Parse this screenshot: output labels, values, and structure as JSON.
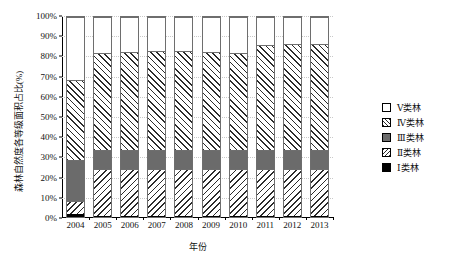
{
  "chart_data": {
    "type": "bar",
    "title": "",
    "subtitle": "",
    "stacked": true,
    "normalized_100": true,
    "xlabel": "年份",
    "ylabel": "森林自然度各等级面积占比(%)",
    "categories": [
      "2004",
      "2005",
      "2006",
      "2007",
      "2008",
      "2009",
      "2010",
      "2011",
      "2012",
      "2013"
    ],
    "ylim": [
      0,
      100
    ],
    "yticks": [
      "0%",
      "10%",
      "20%",
      "30%",
      "40%",
      "50%",
      "60%",
      "70%",
      "80%",
      "90%",
      "100%"
    ],
    "ytick_values": [
      0,
      10,
      20,
      30,
      40,
      50,
      60,
      70,
      80,
      90,
      100
    ],
    "grid": true,
    "legend_position": "right",
    "series": [
      {
        "name": "Ⅰ类林",
        "key": "s1",
        "fill": "solid-black",
        "color": "#000000",
        "values": [
          1.5,
          0.4,
          0.4,
          0.4,
          0.4,
          0.4,
          0.4,
          0.4,
          0.4,
          0.4
        ]
      },
      {
        "name": "Ⅱ类林",
        "key": "s2",
        "fill": "backslash-hatch",
        "color": "#ffffff",
        "values": [
          6.5,
          23.6,
          23.6,
          23.6,
          23.6,
          23.6,
          23.6,
          23.6,
          23.6,
          23.6
        ]
      },
      {
        "name": "Ⅲ类林",
        "key": "s3",
        "fill": "solid-gray",
        "color": "#6b6b6b",
        "values": [
          20.5,
          9.5,
          9.5,
          9.5,
          9.5,
          9.5,
          9.5,
          9.5,
          9.5,
          9.5
        ]
      },
      {
        "name": "Ⅳ类林",
        "key": "s4",
        "fill": "forwardslash-hatch",
        "color": "#ffffff",
        "values": [
          40.0,
          48.5,
          49.0,
          49.5,
          49.5,
          49.0,
          48.5,
          52.5,
          53.0,
          53.0
        ]
      },
      {
        "name": "Ⅴ类林",
        "key": "s5",
        "fill": "solid-white",
        "color": "#ffffff",
        "values": [
          31.5,
          18.0,
          17.5,
          17.0,
          17.0,
          17.5,
          18.0,
          14.0,
          13.5,
          13.5
        ]
      }
    ],
    "legend_entries": [
      "Ⅴ类林",
      "Ⅳ类林",
      "Ⅲ类林",
      "Ⅱ类林",
      "Ⅰ类林"
    ],
    "legend_keys": [
      "s5",
      "s4",
      "s3",
      "s2",
      "s1"
    ]
  }
}
